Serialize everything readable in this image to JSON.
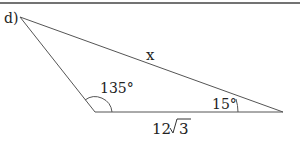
{
  "problem_label": "d)",
  "sides": {
    "hypotenuse": "x",
    "base_coef": "12",
    "base_radicand": "3"
  },
  "angles": {
    "obtuse": "135°",
    "acute": "15°"
  },
  "colors": {
    "line": "#555555",
    "text": "#222222"
  }
}
